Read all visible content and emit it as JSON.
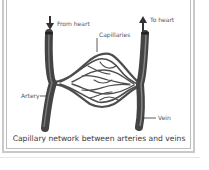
{
  "diagram": {
    "title": "Capillary network between arteries and veins",
    "labels": {
      "from_heart": "From heart",
      "to_heart": "To heart",
      "capillaries": "Capillaries",
      "artery": "Artery",
      "vein": "Vein"
    },
    "caption": "Capillary network between arteries and veins",
    "colors": {
      "vessel": "#4a4a4a",
      "vessel_highlight": "#8a8a8a",
      "border": "#c9c9c9",
      "text": "#555555"
    }
  }
}
